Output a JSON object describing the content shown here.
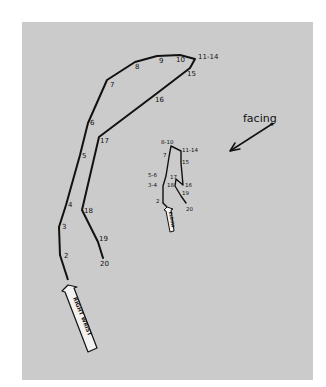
{
  "diagram": {
    "background_color": "#cbcbcb",
    "ink_color": "#111111",
    "wrist_path": {
      "label": "RIGHT WRIST",
      "points": [
        {
          "label": "2",
          "x": 60,
          "y": 255
        },
        {
          "label": "3",
          "x": 59,
          "y": 227
        },
        {
          "label": "4",
          "x": 66,
          "y": 205
        },
        {
          "label": "5",
          "x": 80,
          "y": 155
        },
        {
          "label": "6",
          "x": 88,
          "y": 123
        },
        {
          "label": "7",
          "x": 107,
          "y": 80
        },
        {
          "label": "8",
          "x": 135,
          "y": 62
        },
        {
          "label": "9",
          "x": 157,
          "y": 56
        },
        {
          "label": "10",
          "x": 180,
          "y": 55
        },
        {
          "label": "11-14",
          "x": 195,
          "y": 59
        },
        {
          "label": "15",
          "x": 190,
          "y": 68
        },
        {
          "label": "16",
          "x": 156,
          "y": 94
        },
        {
          "label": "17",
          "x": 99,
          "y": 137
        },
        {
          "label": "18",
          "x": 82,
          "y": 210
        },
        {
          "label": "19",
          "x": 98,
          "y": 242
        },
        {
          "label": "20",
          "x": 103,
          "y": 258
        }
      ]
    },
    "elbow_path": {
      "label": "ELBOW",
      "points": [
        {
          "label": "2",
          "x": 163,
          "y": 203
        },
        {
          "label": "3-4",
          "x": 163,
          "y": 186
        },
        {
          "label": "5-6",
          "x": 166,
          "y": 176
        },
        {
          "label": "7",
          "x": 169,
          "y": 157
        },
        {
          "label": "8-10",
          "x": 171,
          "y": 146
        },
        {
          "label": "11-14",
          "x": 181,
          "y": 151
        },
        {
          "label": "15",
          "x": 181,
          "y": 163
        },
        {
          "label": "16",
          "x": 183,
          "y": 185
        },
        {
          "label": "17",
          "x": 176,
          "y": 179
        },
        {
          "label": "18",
          "x": 175,
          "y": 186
        },
        {
          "label": "19",
          "x": 181,
          "y": 196
        },
        {
          "label": "20",
          "x": 186,
          "y": 203
        }
      ]
    },
    "facing": {
      "label": "facing",
      "arrow_from": {
        "x": 272,
        "y": 124
      },
      "arrow_to": {
        "x": 230,
        "y": 151
      }
    }
  }
}
